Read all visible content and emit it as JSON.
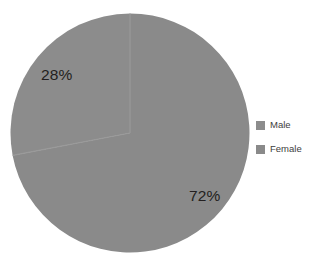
{
  "chart_data": {
    "type": "pie",
    "title": "",
    "categories": [
      "Male",
      "Female"
    ],
    "values": [
      28,
      72
    ],
    "value_labels": [
      "28%",
      "72%"
    ],
    "unit": "percent",
    "slices": [
      {
        "name": "Male",
        "value": 28,
        "label": "28%",
        "color": "#8c8c8c",
        "start_angle_deg": 259.2,
        "end_angle_deg": 360.0
      },
      {
        "name": "Female",
        "value": 72,
        "label": "72%",
        "color": "#8a8a8a",
        "start_angle_deg": 0.0,
        "end_angle_deg": 259.2
      }
    ],
    "legend": {
      "position": "right",
      "entries": [
        {
          "label": "Male",
          "color": "#8c8c8c"
        },
        {
          "label": "Female",
          "color": "#8a8a8a"
        }
      ]
    },
    "background_color": "#ffffff",
    "label_color": "#231f20",
    "grid": false,
    "xlabel": "",
    "ylabel": ""
  },
  "geometry": {
    "center_x": 120,
    "center_y": 120,
    "radius": 119.5,
    "divider_color": "#9a9a9a"
  }
}
